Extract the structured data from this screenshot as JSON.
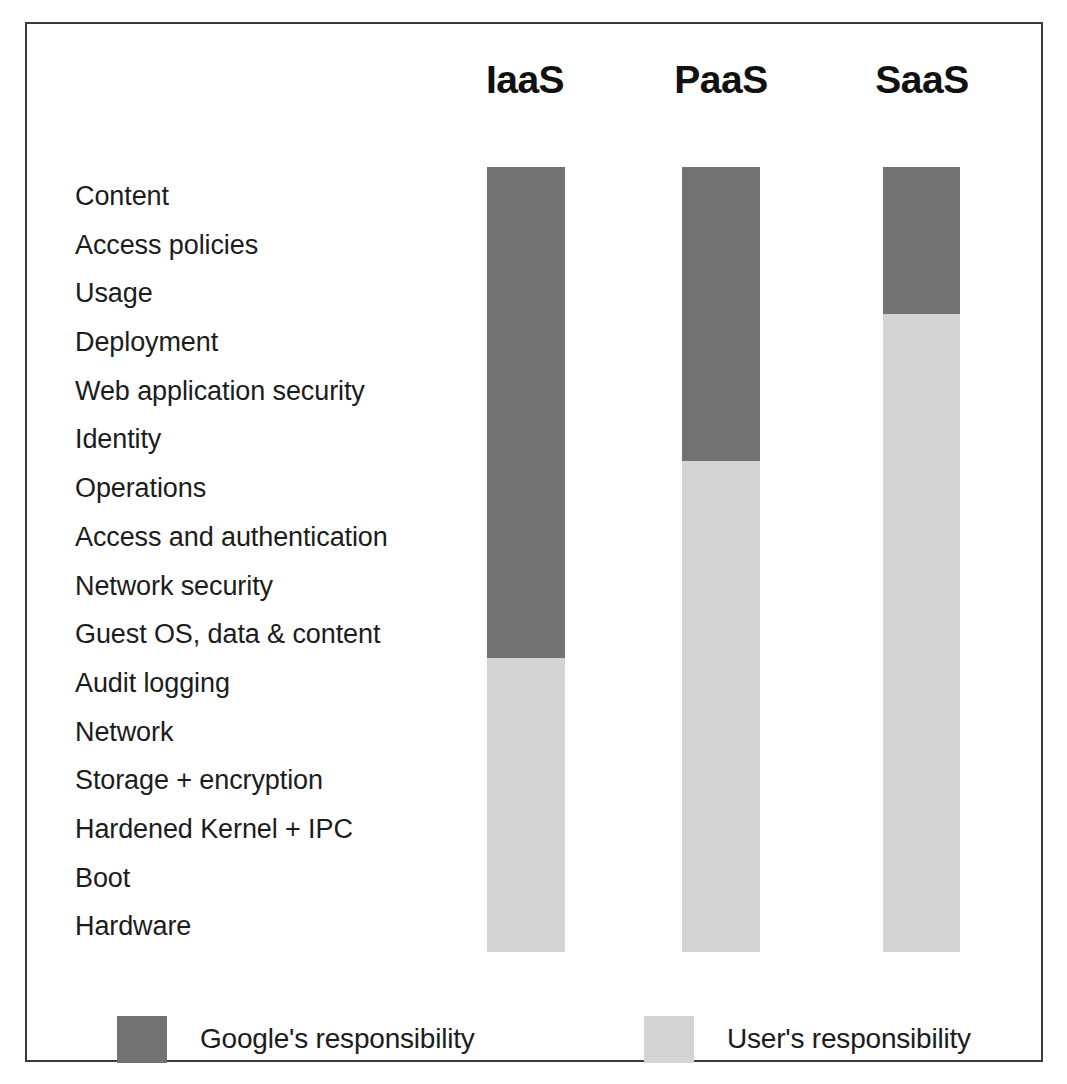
{
  "chart_data": {
    "type": "bar",
    "title": "",
    "subtitle": "",
    "xlabel": "",
    "ylabel": "",
    "orientation": "vertical",
    "stacked": true,
    "grid": false,
    "legend_position": "bottom",
    "categories": [
      "IaaS",
      "PaaS",
      "SaaS"
    ],
    "row_labels": [
      "Content",
      "Access policies",
      "Usage",
      "Deployment",
      "Web application security",
      "Identity",
      "Operations",
      "Access and authentication",
      "Network security",
      "Guest OS, data & content",
      "Audit logging",
      "Network",
      "Storage + encryption",
      "Hardened Kernel + IPC",
      "Boot",
      "Hardware"
    ],
    "series": [
      {
        "name": "Google's responsibility",
        "color": "#727272",
        "values": [
          10,
          6,
          3
        ],
        "units": "rows"
      },
      {
        "name": "User's responsibility",
        "color": "#d4d4d4",
        "values": [
          6,
          10,
          13
        ],
        "units": "rows"
      }
    ],
    "total_rows": 16
  },
  "headers": {
    "iaas": "IaaS",
    "paas": "PaaS",
    "saas": "SaaS"
  },
  "legend": {
    "google_label": "Google's responsibility",
    "user_label": "User's responsibility",
    "google_color": "#727272",
    "user_color": "#d4d4d4"
  }
}
